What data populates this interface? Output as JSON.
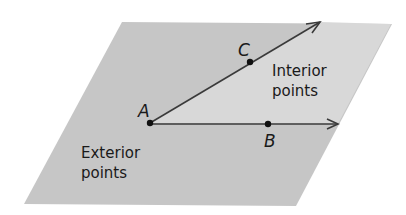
{
  "diagram": {
    "type": "geometry-angle-interior",
    "colors": {
      "background": "#ffffff",
      "plane_exterior": "#c6c6c6",
      "plane_interior": "#d8d8d8",
      "ray": "#3a3a3a",
      "point": "#111111",
      "text": "#1a1a1a"
    },
    "plane": {
      "shape": "parallelogram",
      "corners": [
        [
          122,
          22
        ],
        [
          392,
          24
        ],
        [
          296,
          206
        ],
        [
          24,
          204
        ]
      ]
    },
    "vertex": {
      "label": "A",
      "x": 150,
      "y": 123
    },
    "points": [
      {
        "label": "C",
        "x": 250,
        "y": 62
      },
      {
        "label": "B",
        "x": 268,
        "y": 124
      }
    ],
    "rays": [
      {
        "name": "ray-AC",
        "from": "A",
        "through": "C",
        "tip": [
          320,
          22
        ]
      },
      {
        "name": "ray-AB",
        "from": "A",
        "through": "B",
        "tip": [
          338,
          124
        ]
      }
    ],
    "labels": {
      "point_a": "A",
      "point_b": "B",
      "point_c": "C",
      "interior_line1": "Interior",
      "interior_line2": "points",
      "exterior_line1": "Exterior",
      "exterior_line2": "points"
    }
  }
}
